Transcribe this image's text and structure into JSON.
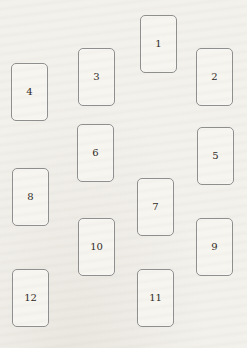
{
  "page": {
    "title": "THE HOROSCOPE SPREAD"
  },
  "colors": {
    "paper": "#f3f1ec",
    "card_fill": "#f7f5f0",
    "card_border": "#8f8f8f",
    "number_ink": "#2f2b26",
    "title_ink": "#26221e"
  },
  "cards": [
    {
      "number": "1",
      "x": 140,
      "y": 15
    },
    {
      "number": "2",
      "x": 196,
      "y": 48
    },
    {
      "number": "3",
      "x": 78,
      "y": 48
    },
    {
      "number": "4",
      "x": 11,
      "y": 63
    },
    {
      "number": "5",
      "x": 197,
      "y": 127
    },
    {
      "number": "6",
      "x": 77,
      "y": 124
    },
    {
      "number": "7",
      "x": 137,
      "y": 178
    },
    {
      "number": "8",
      "x": 12,
      "y": 168
    },
    {
      "number": "9",
      "x": 196,
      "y": 218
    },
    {
      "number": "10",
      "x": 78,
      "y": 218
    },
    {
      "number": "11",
      "x": 137,
      "y": 269
    },
    {
      "number": "12",
      "x": 12,
      "y": 269
    }
  ]
}
